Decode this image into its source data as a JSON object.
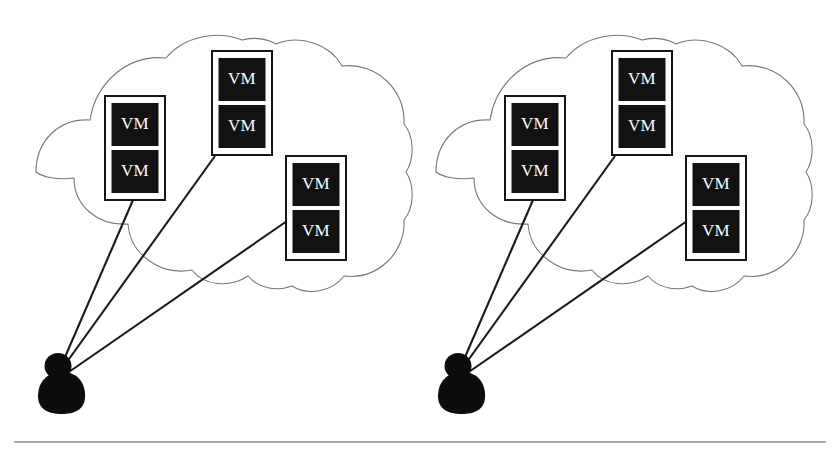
{
  "figure": {
    "background_color": "#ffffff",
    "width": 839,
    "height": 451
  },
  "colors": {
    "cloud_stroke": "#777777",
    "vm_box_border": "#141414",
    "vm_cell_fill": "#121212",
    "vm_label_color": "#ffffff",
    "connector_stroke": "#1a1a1a",
    "person_fill": "#0d0d0d",
    "baseline_rule": "#8a8a8a"
  },
  "clouds": [
    {
      "id": "cloud-left",
      "name": "left-cloud",
      "bounds": {
        "x": 36,
        "y": 40,
        "width": 379,
        "height": 247
      },
      "vm_hosts": [
        {
          "id": "left-host-1",
          "name": "vm-host-left-upper-left",
          "x": 105,
          "y": 96,
          "width": 60,
          "height": 104,
          "vms": [
            {
              "label": "VM"
            },
            {
              "label": "VM"
            }
          ]
        },
        {
          "id": "left-host-2",
          "name": "vm-host-left-top-middle",
          "x": 212,
          "y": 51,
          "width": 60,
          "height": 104,
          "vms": [
            {
              "label": "VM"
            },
            {
              "label": "VM"
            }
          ]
        },
        {
          "id": "left-host-3",
          "name": "vm-host-left-right",
          "x": 286,
          "y": 156,
          "width": 60,
          "height": 104,
          "vms": [
            {
              "label": "VM"
            },
            {
              "label": "VM"
            }
          ]
        }
      ],
      "user": {
        "id": "user-left",
        "name": "user-silhouette-left",
        "head_cx": 58,
        "head_cy": 366,
        "head_r": 13,
        "body_cx": 62,
        "body_cy": 390,
        "body_rx": 22,
        "body_ry": 20
      },
      "connectors": [
        {
          "id": "left-conn-1",
          "name": "connector-user-to-host-1",
          "x1": 62,
          "y1": 364,
          "x2": 133,
          "y2": 200
        },
        {
          "id": "left-conn-2",
          "name": "connector-user-to-host-2",
          "x1": 64,
          "y1": 366,
          "x2": 215,
          "y2": 156
        },
        {
          "id": "left-conn-3",
          "name": "connector-user-to-host-3",
          "x1": 66,
          "y1": 374,
          "x2": 287,
          "y2": 221
        }
      ]
    },
    {
      "id": "cloud-right",
      "name": "right-cloud",
      "bounds": {
        "x": 436,
        "y": 40,
        "width": 379,
        "height": 247
      },
      "vm_hosts": [
        {
          "id": "right-host-1",
          "name": "vm-host-right-upper-left",
          "x": 505,
          "y": 96,
          "width": 60,
          "height": 104,
          "vms": [
            {
              "label": "VM"
            },
            {
              "label": "VM"
            }
          ]
        },
        {
          "id": "right-host-2",
          "name": "vm-host-right-top-middle",
          "x": 612,
          "y": 51,
          "width": 60,
          "height": 104,
          "vms": [
            {
              "label": "VM"
            },
            {
              "label": "VM"
            }
          ]
        },
        {
          "id": "right-host-3",
          "name": "vm-host-right-right",
          "x": 686,
          "y": 156,
          "width": 60,
          "height": 104,
          "vms": [
            {
              "label": "VM"
            },
            {
              "label": "VM"
            }
          ]
        }
      ],
      "user": {
        "id": "user-right",
        "name": "user-silhouette-right",
        "head_cx": 458,
        "head_cy": 366,
        "head_r": 13,
        "body_cx": 462,
        "body_cy": 390,
        "body_rx": 22,
        "body_ry": 20
      },
      "connectors": [
        {
          "id": "right-conn-1",
          "name": "connector-user-to-host-1",
          "x1": 462,
          "y1": 364,
          "x2": 533,
          "y2": 200
        },
        {
          "id": "right-conn-2",
          "name": "connector-user-to-host-2",
          "x1": 464,
          "y1": 366,
          "x2": 615,
          "y2": 156
        },
        {
          "id": "right-conn-3",
          "name": "connector-user-to-host-3",
          "x1": 466,
          "y1": 374,
          "x2": 687,
          "y2": 221
        }
      ]
    }
  ],
  "baseline": {
    "id": "page-baseline",
    "name": "horizontal-rule",
    "x1": 14,
    "y1": 442,
    "x2": 826,
    "y2": 442
  },
  "cloud_path": "M 36 172 C 36 140 60 118 90 120 C 96 82 128 54 166 58 C 184 36 218 30 242 40 C 252 37 266 38 276 44 C 300 34 330 44 342 66 C 376 62 406 90 404 124 C 414 136 415 158 406 172 C 415 186 414 208 404 220 C 406 252 378 280 344 276 C 332 292 308 296 292 286 C 276 292 258 288 248 276 C 230 288 204 286 192 270 C 160 276 130 254 128 224 C 98 226 74 206 74 178 C 60 180 44 178 36 172 Z"
}
